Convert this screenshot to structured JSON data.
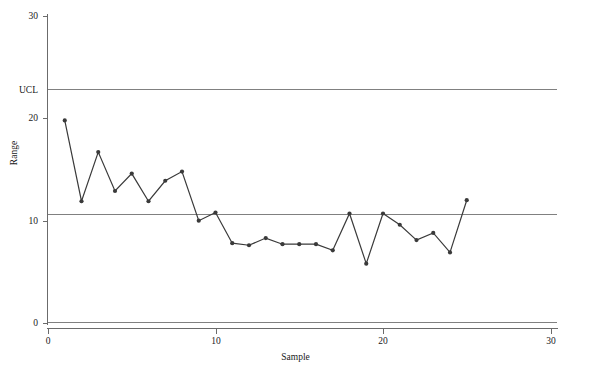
{
  "chart_data": {
    "type": "line",
    "title": "",
    "xlabel": "Sample",
    "ylabel": "Range",
    "xlim": [
      0,
      30.5
    ],
    "ylim": [
      0,
      30
    ],
    "xticks": [
      0,
      10,
      20,
      30
    ],
    "xtick_labels": [
      "0",
      "10",
      "20",
      "30"
    ],
    "yticks": [
      0,
      10,
      20,
      30
    ],
    "ytick_labels": [
      "0",
      "10",
      "20",
      "30"
    ],
    "grid": false,
    "legend": "none",
    "marker": "filled-circle",
    "series_color": "#3a3a3a",
    "limit_color": "#808080",
    "x": [
      1,
      2,
      3,
      4,
      5,
      6,
      7,
      8,
      9,
      10,
      11,
      12,
      13,
      14,
      15,
      16,
      17,
      18,
      19,
      20,
      21,
      22,
      23,
      24,
      25
    ],
    "values": [
      19.8,
      11.9,
      16.7,
      12.9,
      14.6,
      11.9,
      13.9,
      14.8,
      10.0,
      10.8,
      7.8,
      7.6,
      8.3,
      7.7,
      7.7,
      7.7,
      7.1,
      10.7,
      5.8,
      10.7,
      9.6,
      8.1,
      8.8,
      6.9,
      12.0
    ],
    "control_lines": [
      {
        "name": "UCL",
        "label": "UCL",
        "value": 22.8
      },
      {
        "name": "CL",
        "label": "",
        "value": 10.65
      },
      {
        "name": "LCL",
        "label": "",
        "value": 0
      }
    ]
  },
  "axis": {
    "y_title": "Range",
    "x_title": "Sample"
  }
}
